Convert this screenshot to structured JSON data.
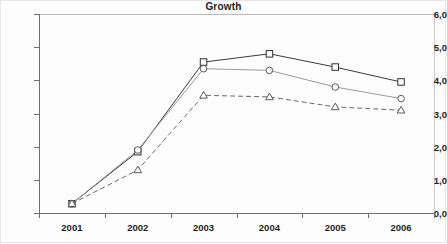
{
  "chart_data": {
    "type": "line",
    "title": "Growth",
    "xlabel": "",
    "ylabel": "",
    "categories": [
      "2001",
      "2002",
      "2003",
      "2004",
      "2005",
      "2006"
    ],
    "ytick_labels": [
      "6,0",
      "5,0",
      "4,0",
      "3,0",
      "2,0",
      "1,0",
      "0,0"
    ],
    "ytick_values": [
      6.0,
      5.0,
      4.0,
      3.0,
      2.0,
      1.0,
      0.0
    ],
    "ylim": [
      0.0,
      6.0
    ],
    "grid": false,
    "legend": "none",
    "decimal_separator": ",",
    "series": [
      {
        "name": "series-square",
        "marker": "square",
        "line_style": "solid",
        "color": "#3a3a3a",
        "values": [
          0.28,
          1.85,
          4.55,
          4.8,
          4.4,
          3.95
        ]
      },
      {
        "name": "series-circle",
        "marker": "circle",
        "line_style": "solid",
        "color": "#9a9a9a",
        "values": [
          0.28,
          1.9,
          4.35,
          4.3,
          3.8,
          3.45
        ]
      },
      {
        "name": "series-triangle",
        "marker": "triangle",
        "line_style": "dashed",
        "color": "#6a6a6a",
        "values": [
          0.28,
          1.3,
          3.55,
          3.5,
          3.2,
          3.1
        ]
      }
    ]
  },
  "axis": {
    "y_min_label": "0,0",
    "y_max_label": "6,0"
  }
}
